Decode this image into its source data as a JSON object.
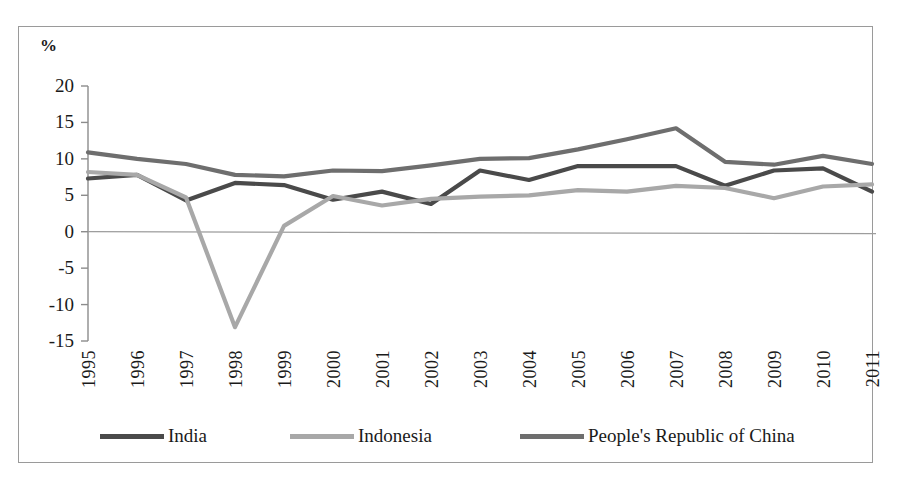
{
  "chart_data": {
    "type": "line",
    "title": "",
    "subtitle": "",
    "xlabel": "",
    "ylabel": "%",
    "axis_unit_label": "%",
    "grid": false,
    "legend_position": "bottom",
    "x": [
      "1995",
      "1996",
      "1997",
      "1998",
      "1999",
      "2000",
      "2001",
      "2002",
      "2003",
      "2004",
      "2005",
      "2006",
      "2007",
      "2008",
      "2009",
      "2010",
      "2011"
    ],
    "categories": [
      "1995",
      "1996",
      "1997",
      "1998",
      "1999",
      "2000",
      "2001",
      "2002",
      "2003",
      "2004",
      "2005",
      "2006",
      "2007",
      "2008",
      "2009",
      "2010",
      "2011"
    ],
    "yticks": [
      20,
      15,
      10,
      5,
      0,
      -5,
      -10,
      -15
    ],
    "ytick_labels": [
      "20",
      "15",
      "10",
      "5",
      "0",
      "-5",
      "-10",
      "-15"
    ],
    "ylim": [
      -15,
      20
    ],
    "xlim": [
      "1995",
      "2011"
    ],
    "zero_line": 0,
    "series": [
      {
        "name": "India",
        "color": "#4a4a4a",
        "values": [
          7.3,
          7.8,
          4.3,
          6.7,
          6.4,
          4.4,
          5.5,
          3.8,
          8.4,
          7.1,
          9.0,
          9.0,
          9.0,
          6.3,
          8.4,
          8.7,
          5.5
        ]
      },
      {
        "name": "Indonesia",
        "color": "#a8a8a8",
        "values": [
          8.2,
          7.8,
          4.7,
          -13.1,
          0.8,
          4.9,
          3.6,
          4.5,
          4.8,
          5.0,
          5.7,
          5.5,
          6.3,
          6.0,
          4.6,
          6.2,
          6.5
        ]
      },
      {
        "name": "People's Republic of China",
        "color": "#6e6e6e",
        "values": [
          10.9,
          10.0,
          9.3,
          7.8,
          7.6,
          8.4,
          8.3,
          9.1,
          10.0,
          10.1,
          11.3,
          12.7,
          14.2,
          9.6,
          9.2,
          10.4,
          9.3
        ]
      }
    ]
  },
  "legend": {
    "entries": [
      {
        "label": "India",
        "color": "#4a4a4a"
      },
      {
        "label": "Indonesia",
        "color": "#a8a8a8"
      },
      {
        "label": "People's Republic of China",
        "color": "#6e6e6e"
      }
    ]
  }
}
